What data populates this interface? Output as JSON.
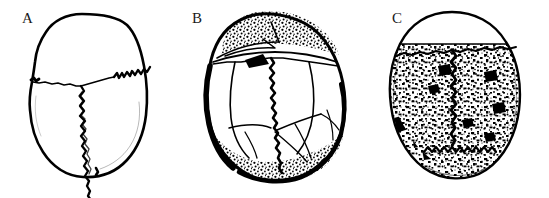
{
  "figure": {
    "background_color": "#ffffff",
    "ink_color": "#000000",
    "width": 549,
    "height": 198,
    "type": "line-drawing-figure"
  },
  "panels": [
    {
      "label": "A",
      "name": "skull-panel-a",
      "caption": "",
      "features": {
        "outline": "smooth ovoid cranium, narrow anterior, broad posterior",
        "sutures": "coronal suture and sagittal suture visible; sagittal strongly serrated",
        "surface": "clean, unmarked bone surface with no porosity",
        "stippling": "none"
      }
    },
    {
      "label": "B",
      "name": "skull-panel-b",
      "caption": "",
      "features": {
        "outline": "obliquely tilted ovoid cranium with thickened dark margins",
        "sutures": "coronal, sagittal, lambdoid and accessory cracks widely separated into plates",
        "surface": "bone plates separated by open fissures",
        "stippling": "dense stippled eroded band along superior and inferior margins"
      }
    },
    {
      "label": "C",
      "name": "skull-panel-c",
      "caption": "",
      "features": {
        "outline": "rounded ovoid cranium, smooth continuous contour",
        "sutures": "coronal suture across upper third; sagittal suture faint; lambdoid serrated near base",
        "surface": "heavily mottled and pitted with coarse porosity",
        "stippling": "dense irregular black stippling over entire vault"
      }
    }
  ]
}
